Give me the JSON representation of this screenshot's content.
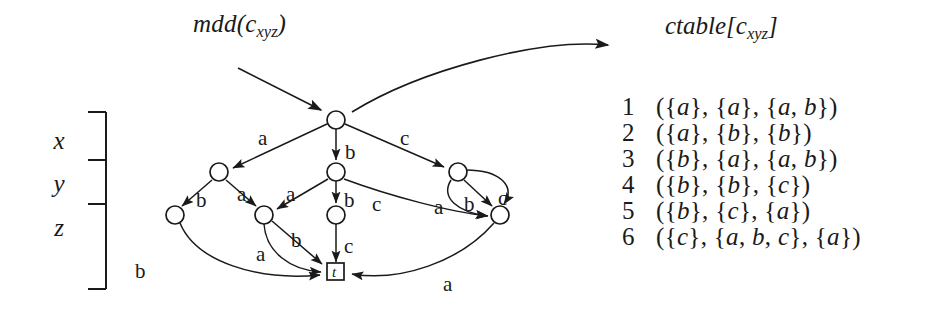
{
  "figure": {
    "background_color": "#ffffff",
    "stroke_color": "#1a1a1a",
    "mdd_label": "mdd(c",
    "mdd_label_sub": "xyz",
    "mdd_label_close": ")",
    "ctable_label": "ctable[c",
    "ctable_label_sub": "xyz",
    "ctable_label_close": "]"
  },
  "variables": {
    "levels": [
      {
        "name": "x"
      },
      {
        "name": "y"
      },
      {
        "name": "z"
      }
    ]
  },
  "ctable": {
    "rows": [
      {
        "num": "1",
        "tuple": "({a}, {a}, {a, b})",
        "sets": [
          [
            "a"
          ],
          [
            "a"
          ],
          [
            "a",
            "b"
          ]
        ]
      },
      {
        "num": "2",
        "tuple": "({a}, {b}, {b})",
        "sets": [
          [
            "a"
          ],
          [
            "b"
          ],
          [
            "b"
          ]
        ]
      },
      {
        "num": "3",
        "tuple": "({b}, {a}, {a, b})",
        "sets": [
          [
            "b"
          ],
          [
            "a"
          ],
          [
            "a",
            "b"
          ]
        ]
      },
      {
        "num": "4",
        "tuple": "({b}, {b}, {c})",
        "sets": [
          [
            "b"
          ],
          [
            "b"
          ],
          [
            "c"
          ]
        ]
      },
      {
        "num": "5",
        "tuple": "({b}, {c}, {a})",
        "sets": [
          [
            "b"
          ],
          [
            "c"
          ],
          [
            "a"
          ]
        ]
      },
      {
        "num": "6",
        "tuple": "({c}, {a, b, c}, {a})",
        "sets": [
          [
            "c"
          ],
          [
            "a",
            "b",
            "c"
          ],
          [
            "a"
          ]
        ]
      }
    ]
  },
  "graph": {
    "nodes": [
      {
        "id": "root",
        "level": "x",
        "cx": 336,
        "cy": 120,
        "r": 9,
        "shape": "circle"
      },
      {
        "id": "y1",
        "level": "y",
        "cx": 219,
        "cy": 172,
        "r": 9,
        "shape": "circle"
      },
      {
        "id": "y2",
        "level": "y",
        "cx": 336,
        "cy": 172,
        "r": 9,
        "shape": "circle"
      },
      {
        "id": "y3",
        "level": "y",
        "cx": 458,
        "cy": 172,
        "r": 9,
        "shape": "circle"
      },
      {
        "id": "z1",
        "level": "z",
        "cx": 175,
        "cy": 215,
        "r": 9,
        "shape": "circle"
      },
      {
        "id": "z2",
        "level": "z",
        "cx": 264,
        "cy": 215,
        "r": 9,
        "shape": "circle"
      },
      {
        "id": "z3",
        "level": "z",
        "cx": 336,
        "cy": 215,
        "r": 9,
        "shape": "circle"
      },
      {
        "id": "z4",
        "level": "z",
        "cx": 500,
        "cy": 215,
        "r": 9,
        "shape": "circle"
      },
      {
        "id": "terminal",
        "level": "terminal",
        "cx": 336,
        "cy": 272,
        "r": 8,
        "shape": "square",
        "label": "t"
      }
    ],
    "edge_labels": [
      {
        "text": "a",
        "x": 258,
        "y": 126,
        "for": "root-y1"
      },
      {
        "text": "b",
        "x": 345,
        "y": 140,
        "for": "root-y2"
      },
      {
        "text": "c",
        "x": 400,
        "y": 126,
        "for": "root-y3"
      },
      {
        "text": "b",
        "x": 196,
        "y": 188,
        "for": "y1-z1"
      },
      {
        "text": "a",
        "x": 237,
        "y": 182,
        "for": "y1-z2"
      },
      {
        "text": "a",
        "x": 286,
        "y": 182,
        "for": "y2-z2"
      },
      {
        "text": "b",
        "x": 344,
        "y": 188,
        "for": "y2-z3"
      },
      {
        "text": "c",
        "x": 372,
        "y": 192,
        "for": "y2-z4"
      },
      {
        "text": "a",
        "x": 434,
        "y": 195,
        "for": "y3-t"
      },
      {
        "text": "b",
        "x": 464,
        "y": 192,
        "for": "y3-z4"
      },
      {
        "text": "c",
        "x": 498,
        "y": 186,
        "for": "y3-z4b"
      },
      {
        "text": "b",
        "x": 135,
        "y": 259,
        "for": "z1-t"
      },
      {
        "text": "a",
        "x": 256,
        "y": 242,
        "for": "z2-t"
      },
      {
        "text": "b",
        "x": 291,
        "y": 228,
        "for": "z2-tb"
      },
      {
        "text": "c",
        "x": 344,
        "y": 234,
        "for": "z3-t"
      },
      {
        "text": "a",
        "x": 443,
        "y": 272,
        "for": "z4-t"
      }
    ]
  }
}
